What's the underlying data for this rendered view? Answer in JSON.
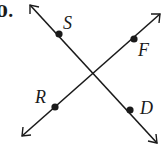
{
  "problem_number": "0.",
  "lines": [
    {
      "name": "line-SD",
      "from": [
        30,
        5
      ],
      "to": [
        157,
        143
      ]
    },
    {
      "name": "line-RF",
      "from": [
        22,
        136
      ],
      "to": [
        160,
        14
      ]
    }
  ],
  "points": [
    {
      "label": "S",
      "x": 59,
      "y": 34,
      "lx": 63,
      "ly": 29
    },
    {
      "label": "F",
      "x": 134,
      "y": 39,
      "lx": 138,
      "ly": 56
    },
    {
      "label": "R",
      "x": 55,
      "y": 107,
      "lx": 35,
      "ly": 103
    },
    {
      "label": "D",
      "x": 130,
      "y": 110,
      "lx": 140,
      "ly": 114
    }
  ],
  "colors": {
    "stroke": "#1a1a1a",
    "background": "#ffffff"
  }
}
